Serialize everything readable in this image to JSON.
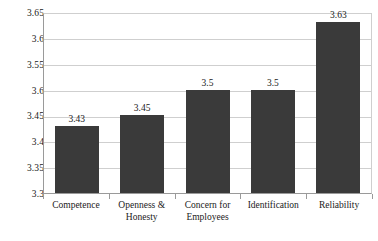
{
  "chart_data": {
    "type": "bar",
    "title": "",
    "subtitle": "",
    "xlabel": "",
    "ylabel": "",
    "categories": [
      "Competence",
      "Openness & Honesty",
      "Concern for Employees",
      "Identification",
      "Reliability"
    ],
    "category_lines": [
      [
        "Competence"
      ],
      [
        "Openness &",
        "Honesty"
      ],
      [
        "Concern for",
        "Employees"
      ],
      [
        "Identification"
      ],
      [
        "Reliability"
      ]
    ],
    "values": [
      3.43,
      3.45,
      3.5,
      3.5,
      3.63
    ],
    "value_labels": [
      "3.43",
      "3.45",
      "3.5",
      "3.5",
      "3.63"
    ],
    "ylim": [
      3.3,
      3.65
    ],
    "ytick_values": [
      3.65,
      3.6,
      3.55,
      3.5,
      3.45,
      3.4,
      3.35,
      3.3
    ],
    "ytick_labels": [
      "3.65",
      "3.6",
      "3.55",
      "3.6",
      "3.45",
      "3.4",
      "3.35",
      "3.3"
    ],
    "grid": true,
    "legend": false,
    "legend_position": "none",
    "bar_color": "#3a3a3a",
    "gridline_color": "#cfcfcf",
    "axis_color": "#9a9a9a",
    "background_color": "#ffffff"
  }
}
